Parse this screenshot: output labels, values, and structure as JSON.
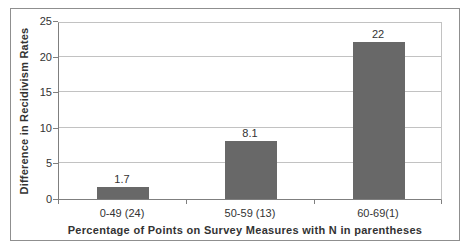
{
  "chart": {
    "y_axis_title": "Difference in Recidivism Rates",
    "x_axis_title": "Percentage of Points on Survey Measures with N in parentheses"
  },
  "chart_data": {
    "type": "bar",
    "categories": [
      "0-49 (24)",
      "50-59 (13)",
      "60-69(1)"
    ],
    "values": [
      1.7,
      8.1,
      22
    ],
    "data_labels": [
      "1.7",
      "8.1",
      "22"
    ],
    "title": "",
    "xlabel": "Percentage of Points on Survey Measures with N in parentheses",
    "ylabel": "Difference in Recidivism Rates",
    "ylim": [
      0,
      25
    ],
    "yticks": [
      0,
      5,
      10,
      15,
      20,
      25
    ],
    "grid": true,
    "legend": false,
    "colors": {
      "bar_fill": "#686868",
      "gridline": "#c2c2c2",
      "axis_line": "#7f7f7f",
      "frame_border": "#8f8f8f",
      "text": "#333333",
      "background": "#ffffff"
    }
  }
}
